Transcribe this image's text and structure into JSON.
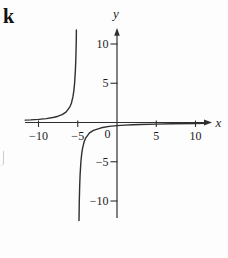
{
  "figure": {
    "corner_label": "k"
  },
  "colors": {
    "background": "#fdfdfd",
    "axis": "#2f2f2f",
    "curve": "#2f2f2f",
    "text": "#1c1c1c"
  },
  "chart_data": {
    "type": "line",
    "title": "",
    "xlabel": "x",
    "ylabel": "y",
    "origin_label": "0",
    "xlim": [
      -11.7,
      11.5
    ],
    "ylim": [
      -12.5,
      12
    ],
    "grid": false,
    "legend": false,
    "x_ticks": [
      {
        "v": -10,
        "label": "−10"
      },
      {
        "v": -5,
        "label": "−5"
      },
      {
        "v": 5,
        "label": "5"
      },
      {
        "v": 10,
        "label": "10"
      }
    ],
    "y_ticks": [
      {
        "v": 10,
        "label": "10"
      },
      {
        "v": 5,
        "label": "5"
      },
      {
        "v": -5,
        "label": "−5"
      },
      {
        "v": -10,
        "label": "−10"
      }
    ],
    "asymptotes": {
      "vertical_x": -5,
      "horizontal_y": 0
    },
    "model": "y ≈ −2/(x+5)",
    "series": [
      {
        "name": "left branch (x < −5)",
        "points": [
          [
            -11.7,
            0.3
          ],
          [
            -11,
            0.33
          ],
          [
            -10,
            0.4
          ],
          [
            -9,
            0.5
          ],
          [
            -8,
            0.67
          ],
          [
            -7.5,
            0.8
          ],
          [
            -7,
            1
          ],
          [
            -6.5,
            1.33
          ],
          [
            -6,
            2
          ],
          [
            -5.8,
            2.5
          ],
          [
            -5.6,
            3.33
          ],
          [
            -5.5,
            4
          ],
          [
            -5.4,
            5
          ],
          [
            -5.3,
            6.67
          ],
          [
            -5.25,
            8
          ],
          [
            -5.2,
            10
          ],
          [
            -5.17,
            11.8
          ]
        ]
      },
      {
        "name": "right branch (x > −5)",
        "points": [
          [
            -4.84,
            -12.5
          ],
          [
            -4.8,
            -10
          ],
          [
            -4.75,
            -8
          ],
          [
            -4.7,
            -6.67
          ],
          [
            -4.6,
            -5
          ],
          [
            -4.5,
            -4
          ],
          [
            -4.4,
            -3.33
          ],
          [
            -4.2,
            -2.5
          ],
          [
            -4,
            -2
          ],
          [
            -3.5,
            -1.33
          ],
          [
            -3,
            -1
          ],
          [
            -2,
            -0.67
          ],
          [
            -1,
            -0.5
          ],
          [
            0,
            -0.4
          ],
          [
            1,
            -0.33
          ],
          [
            2,
            -0.29
          ],
          [
            3,
            -0.25
          ],
          [
            5,
            -0.2
          ],
          [
            7,
            -0.17
          ],
          [
            10,
            -0.13
          ],
          [
            11.2,
            -0.12
          ]
        ]
      }
    ]
  }
}
